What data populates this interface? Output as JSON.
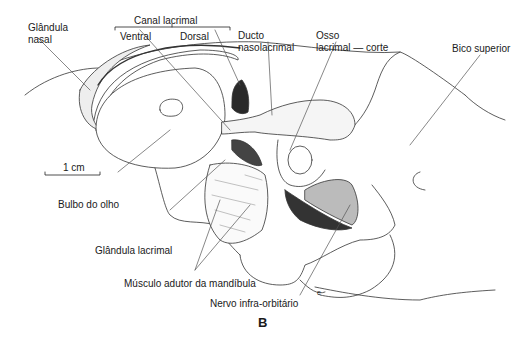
{
  "figure": {
    "panel_letter": "B",
    "scale_bar": {
      "label": "1 cm"
    },
    "labels": {
      "glandula_nasal_1": "Glândula",
      "glandula_nasal_2": "nasal",
      "canal_lacrimal": "Canal lacrimal",
      "ventral": "Ventral",
      "dorsal": "Dorsal",
      "ducto_1": "Ducto",
      "ducto_2": "nasolacrimal",
      "osso_1": "Osso",
      "osso_2": "lacrimal — corte",
      "bico_superior": "Bico superior",
      "bulbo_do_olho": "Bulbo do olho",
      "glandula_lacrimal": "Glândula lacrimal",
      "musculo_adutor": "Músculo adutor da mandíbula",
      "nervo_infra": "Nervo infra-orbitário",
      "small_mark": "e"
    }
  }
}
